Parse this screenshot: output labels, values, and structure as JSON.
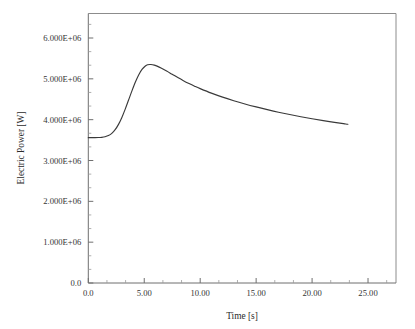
{
  "chart_data": {
    "type": "line",
    "title": "",
    "xlabel": "Time [s]",
    "ylabel": "Electric Power [W]",
    "xlim": [
      0,
      27.5
    ],
    "ylim": [
      0,
      6600000
    ],
    "grid": false,
    "legend": null,
    "x_tick_labels": [
      "0.0",
      "5.00",
      "10.00",
      "15.00",
      "20.00",
      "25.00"
    ],
    "x_tick_values": [
      0,
      5,
      10,
      15,
      20,
      25
    ],
    "y_tick_labels": [
      "0.0",
      "1.000E+06",
      "2.000E+06",
      "3.000E+06",
      "4.000E+06",
      "5.000E+06",
      "6.000E+06"
    ],
    "y_tick_values": [
      0,
      1000000,
      2000000,
      3000000,
      4000000,
      5000000,
      6000000
    ],
    "x_minor_per_interval": 2,
    "y_minor_per_interval": 2,
    "series": [
      {
        "name": "Electric Power",
        "color": "#3a3a3a",
        "x": [
          0.0,
          0.3,
          0.6,
          0.9,
          1.2,
          1.5,
          1.8,
          2.1,
          2.4,
          2.7,
          3.0,
          3.3,
          3.6,
          3.9,
          4.2,
          4.5,
          4.8,
          5.1,
          5.3,
          5.6,
          5.9,
          6.2,
          6.5,
          7.0,
          7.5,
          8.0,
          8.5,
          9.0,
          9.5,
          10.0,
          11.0,
          12.0,
          13.0,
          14.0,
          15.0,
          16.0,
          17.0,
          18.0,
          19.0,
          20.0,
          21.0,
          22.0,
          23.0,
          23.2
        ],
        "y": [
          3560000,
          3560000,
          3560000,
          3562000,
          3568000,
          3582000,
          3610000,
          3665000,
          3755000,
          3885000,
          4055000,
          4258000,
          4480000,
          4705000,
          4915000,
          5095000,
          5230000,
          5315000,
          5345000,
          5350000,
          5335000,
          5305000,
          5265000,
          5190000,
          5110000,
          5030000,
          4955000,
          4885000,
          4820000,
          4760000,
          4650000,
          4552000,
          4465000,
          4385000,
          4312000,
          4245000,
          4182000,
          4125000,
          4072000,
          4022000,
          3975000,
          3932000,
          3895000,
          3888000
        ]
      }
    ]
  },
  "axes": {
    "x_axis_name": "time-axis",
    "y_axis_name": "power-axis"
  }
}
